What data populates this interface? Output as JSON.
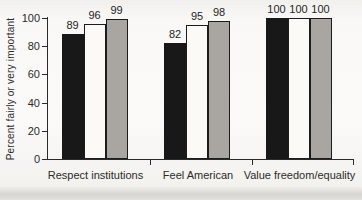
{
  "chart_data": {
    "type": "bar",
    "title": "",
    "xlabel": "",
    "ylabel": "Percent fairly or very important",
    "ylim": [
      0,
      100
    ],
    "yticks": [
      0,
      20,
      40,
      60,
      80,
      100
    ],
    "grid": false,
    "legend": "none",
    "value_labels_shown": true,
    "categories": [
      "Respect institutions",
      "Feel American",
      "Value freedom/equality"
    ],
    "series": [
      {
        "name": "black-bars",
        "color": "#181818",
        "border_color": "#181818",
        "values": [
          89,
          82,
          100
        ]
      },
      {
        "name": "white-bars",
        "color": "#fbfaf7",
        "border_color": "#1c1c1c",
        "values": [
          96,
          95,
          100
        ]
      },
      {
        "name": "gray-bars",
        "color": "#a9a6a1",
        "border_color": "#1c1c1c",
        "values": [
          99,
          98,
          100
        ]
      }
    ]
  },
  "style": {
    "axis_color": "#2a2a2a",
    "text_color": "#2b2b2b",
    "page_background": "#f8f7f5"
  }
}
